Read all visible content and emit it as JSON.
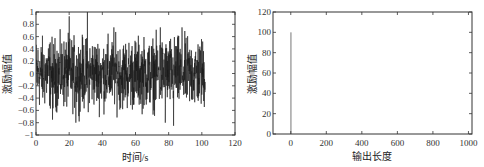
{
  "chart_data": [
    {
      "type": "line",
      "title": "",
      "xlabel": "时间/s",
      "ylabel": "激励幅值",
      "xlim": [
        0,
        120
      ],
      "ylim": [
        -1,
        1
      ],
      "xticks": [
        0,
        20,
        40,
        60,
        80,
        100,
        120
      ],
      "yticks": [
        -1,
        -0.8,
        -0.6,
        -0.4,
        -0.2,
        0,
        0.2,
        0.4,
        0.6,
        0.8,
        1
      ],
      "ytick_labels": [
        "−1",
        "−0.8",
        "−0.6",
        "−0.4",
        "−0.2",
        "0",
        "0.2",
        "0.4",
        "0.6",
        "0.8",
        "1"
      ],
      "grid": false,
      "legend": null,
      "series": [
        {
          "name": "random excitation signal",
          "description": "dense random noise, t from 0 to ~102 s, amplitude mostly within ±0.8, peaks near 0.95 (t≈20) and 1.0 (t≈31)",
          "x_range": [
            0,
            102
          ],
          "approx_points": 1024,
          "notable_peaks": [
            {
              "x": 20,
              "y": 0.93
            },
            {
              "x": 31,
              "y": 1.0
            },
            {
              "x": 47,
              "y": 0.75
            },
            {
              "x": 75,
              "y": 0.75
            },
            {
              "x": 88,
              "y": 0.75
            },
            {
              "x": 10,
              "y": -0.75
            },
            {
              "x": 24,
              "y": -0.8
            },
            {
              "x": 78,
              "y": -0.8
            },
            {
              "x": 83,
              "y": -0.85
            }
          ]
        }
      ]
    },
    {
      "type": "line",
      "title": "",
      "xlabel": "输出长度",
      "ylabel": "激励幅值",
      "xlim": [
        -100,
        1020
      ],
      "ylim": [
        0,
        120
      ],
      "xticks": [
        0,
        200,
        400,
        600,
        800,
        1000
      ],
      "yticks": [
        0,
        20,
        40,
        60,
        80,
        100,
        120
      ],
      "grid": false,
      "legend": null,
      "series": [
        {
          "name": "impulse excitation",
          "x": [
            0,
            1,
            2,
            1020
          ],
          "y": [
            0,
            100,
            0,
            0
          ]
        }
      ]
    }
  ],
  "plots": {
    "left": {
      "xlabel": "时间/s",
      "ylabel": "激励幅值",
      "xtick_labels": [
        "0",
        "20",
        "40",
        "60",
        "80",
        "100",
        "120"
      ],
      "ytick_labels": [
        "−1",
        "−0.8",
        "−0.6",
        "−0.4",
        "−0.2",
        "0",
        "0.2",
        "0.4",
        "0.6",
        "0.8",
        "1"
      ]
    },
    "right": {
      "xlabel": "输出长度",
      "ylabel": "激励幅值",
      "xtick_labels": [
        "0",
        "200",
        "400",
        "600",
        "800",
        "1000"
      ],
      "ytick_labels": [
        "0",
        "20",
        "40",
        "60",
        "80",
        "100",
        "120"
      ]
    }
  },
  "style": {
    "line_color": "#1a1a1a",
    "spike_color": "#777777",
    "axis_color": "#333333"
  }
}
